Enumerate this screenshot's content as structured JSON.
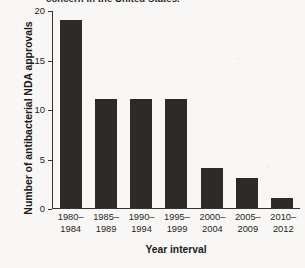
{
  "caption": {
    "clipped_text": "concern in the United States."
  },
  "chart_data": {
    "type": "bar",
    "title": "",
    "xlabel": "Year interval",
    "ylabel": "Number of antibacterial NDA approvals",
    "categories": [
      "1980–1984",
      "1985–1989",
      "1990–1994",
      "1995–1999",
      "2000–2004",
      "2005–2009",
      "2010–2012"
    ],
    "category_lines": [
      [
        "1980–",
        "1984"
      ],
      [
        "1985–",
        "1989"
      ],
      [
        "1990–",
        "1994"
      ],
      [
        "1995–",
        "1999"
      ],
      [
        "2000–",
        "2004"
      ],
      [
        "2005–",
        "2009"
      ],
      [
        "2010–",
        "2012"
      ]
    ],
    "values": [
      19,
      11,
      11,
      11,
      4,
      3,
      1
    ],
    "ylim": [
      0,
      20
    ],
    "yticks": [
      0,
      5,
      10,
      15,
      20
    ],
    "ytick_labels": [
      "0",
      "5",
      "10",
      "15",
      "20"
    ],
    "grid": false,
    "legend": null,
    "bar_color": "#2c2b29",
    "axis_color": "#35332f",
    "background_color": "#f8f7f5"
  }
}
